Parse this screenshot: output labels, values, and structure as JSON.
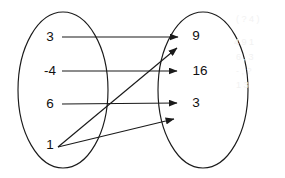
{
  "diagram": {
    "type": "mapping-diagram",
    "stroke_color": "#1a1a1a",
    "text_color": "#111111",
    "background_color": "#ffffff",
    "domain": {
      "name": "domain-set",
      "shape": "ellipse",
      "cx": 63,
      "cy": 90,
      "rx": 45,
      "ry": 78,
      "elements": [
        {
          "label": "3",
          "x": 50,
          "y": 37
        },
        {
          "label": "-4",
          "x": 50,
          "y": 71
        },
        {
          "label": "6",
          "x": 50,
          "y": 104
        },
        {
          "label": "1",
          "x": 50,
          "y": 145
        }
      ]
    },
    "range": {
      "name": "range-set",
      "shape": "ellipse",
      "cx": 203,
      "cy": 90,
      "rx": 45,
      "ry": 78,
      "elements": [
        {
          "label": "9",
          "x": 196,
          "y": 36
        },
        {
          "label": "16",
          "x": 200,
          "y": 71
        },
        {
          "label": "3",
          "x": 196,
          "y": 103
        }
      ]
    },
    "arrows": [
      {
        "name": "arrow-3-to-9",
        "from": "3",
        "to": "9",
        "x1": 62,
        "y1": 37,
        "x2": 178,
        "y2": 37
      },
      {
        "name": "arrow-neg4-to-16",
        "from": "-4",
        "to": "16",
        "x1": 62,
        "y1": 71,
        "x2": 177,
        "y2": 71
      },
      {
        "name": "arrow-6-to-3",
        "from": "6",
        "to": "3",
        "x1": 62,
        "y1": 104,
        "x2": 177,
        "y2": 103
      },
      {
        "name": "arrow-1-to-upper",
        "from": "1",
        "to": "unlabeled",
        "x1": 58,
        "y1": 147,
        "x2": 177,
        "y2": 48
      },
      {
        "name": "arrow-1-to-lower",
        "from": "1",
        "to": "unlabeled",
        "x1": 58,
        "y1": 147,
        "x2": 174,
        "y2": 119
      }
    ],
    "ghost_marks": [
      {
        "text": "( ? 4 )",
        "x": 236,
        "y": 20
      },
      {
        "text": "4  9 1",
        "x": 234,
        "y": 43
      },
      {
        "text": "6 , 3",
        "x": 236,
        "y": 58
      },
      {
        "text": "- , ?",
        "x": 236,
        "y": 72
      },
      {
        "text": "1 3",
        "x": 236,
        "y": 86
      }
    ]
  }
}
